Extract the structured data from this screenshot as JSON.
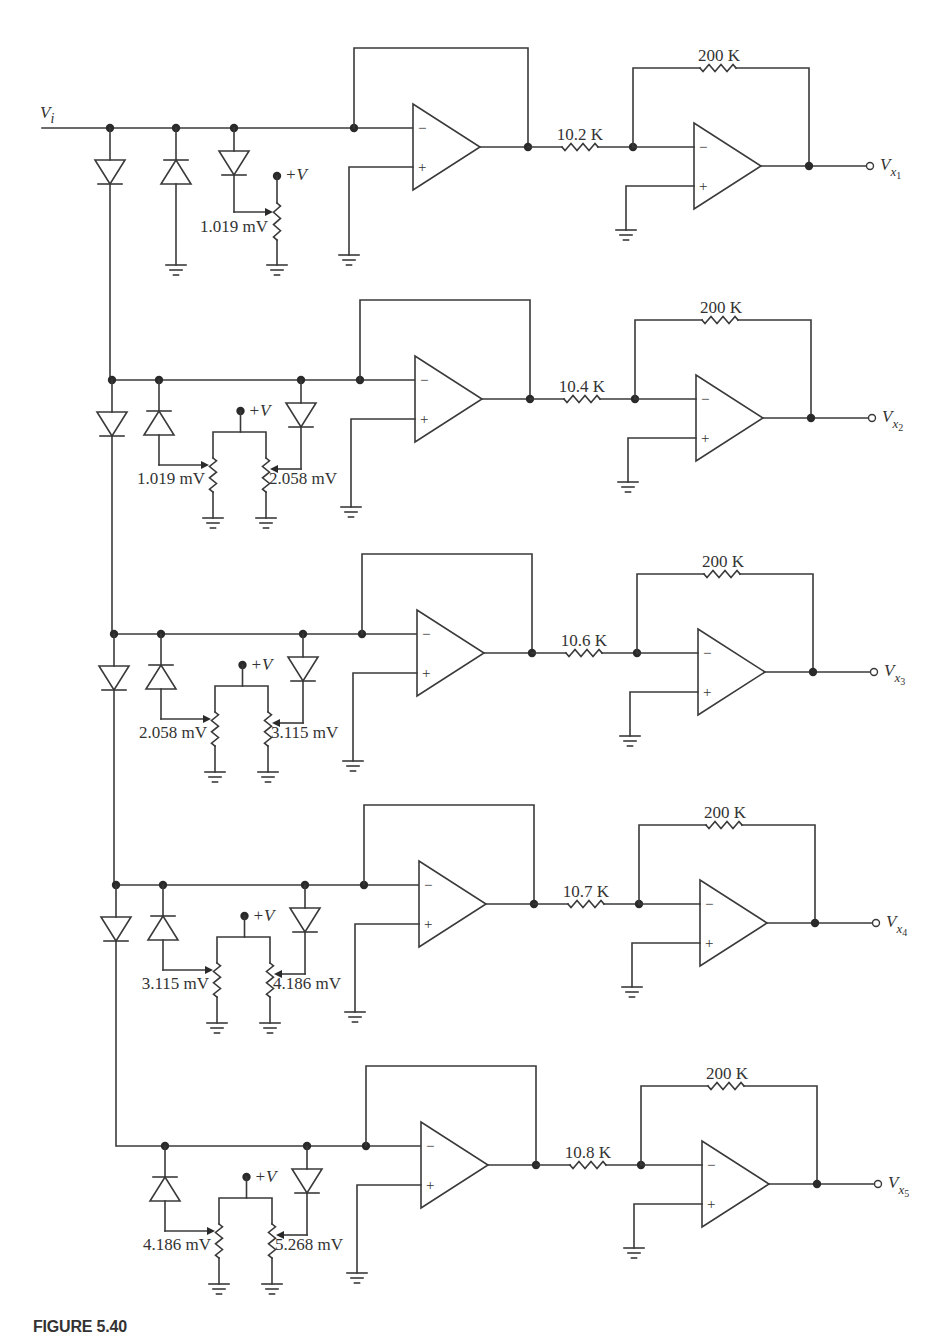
{
  "figure": {
    "caption": "FIGURE 5.40",
    "input_label": "V",
    "input_label_sub": "i",
    "supply_label": "+V",
    "feedback_resistor": "200 K",
    "colors": {
      "line": "#3a3a3a",
      "node": "#2a2a2a",
      "text": "#333333",
      "background": "#ffffff"
    }
  },
  "stages": [
    {
      "id": 1,
      "bus_y": 128,
      "input_resistor": "10.2 K",
      "output_label": "V",
      "output_sub": "x",
      "output_index": "1",
      "pot_labels": [
        "1.019 mV"
      ],
      "type": "first"
    },
    {
      "id": 2,
      "bus_y": 380,
      "input_resistor": "10.4 K",
      "output_label": "V",
      "output_sub": "x",
      "output_index": "2",
      "pot_labels": [
        "1.019 mV",
        "2.058 mV"
      ],
      "type": "middle"
    },
    {
      "id": 3,
      "bus_y": 634,
      "input_resistor": "10.6 K",
      "output_label": "V",
      "output_sub": "x",
      "output_index": "3",
      "pot_labels": [
        "2.058 mV",
        "3.115 mV"
      ],
      "type": "middle"
    },
    {
      "id": 4,
      "bus_y": 885,
      "input_resistor": "10.7 K",
      "output_label": "V",
      "output_sub": "x",
      "output_index": "4",
      "pot_labels": [
        "3.115 mV",
        "4.186 mV"
      ],
      "type": "middle"
    },
    {
      "id": 5,
      "bus_y": 1146,
      "input_resistor": "10.8 K",
      "output_label": "V",
      "output_sub": "x",
      "output_index": "5",
      "pot_labels": [
        "4.186 mV",
        "5.268 mV"
      ],
      "type": "last"
    }
  ]
}
